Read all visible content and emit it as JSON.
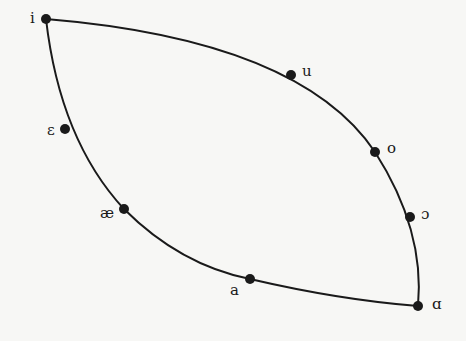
{
  "diagram": {
    "type": "vowel-diagram",
    "line_color": "#1a1a1a",
    "background": "#f7f7f5",
    "points": [
      {
        "id": "i",
        "label": "i",
        "x": 46,
        "y": 19,
        "lx": 30,
        "ly": 11
      },
      {
        "id": "u",
        "label": "u",
        "x": 291,
        "y": 75,
        "lx": 302,
        "ly": 64
      },
      {
        "id": "o",
        "label": "o",
        "x": 375,
        "y": 152,
        "lx": 387,
        "ly": 141
      },
      {
        "id": "open-o",
        "label": "ɔ",
        "x": 410,
        "y": 217,
        "lx": 421,
        "ly": 207
      },
      {
        "id": "ɑ",
        "label": "ɑ",
        "x": 418,
        "y": 306,
        "lx": 432,
        "ly": 297
      },
      {
        "id": "a",
        "label": "a",
        "x": 250,
        "y": 279,
        "lx": 230,
        "ly": 283
      },
      {
        "id": "ae",
        "label": "æ",
        "x": 124,
        "y": 209,
        "lx": 100,
        "ly": 206
      },
      {
        "id": "epsilon",
        "label": "ε",
        "x": 65,
        "y": 129,
        "lx": 47,
        "ly": 123
      }
    ]
  }
}
